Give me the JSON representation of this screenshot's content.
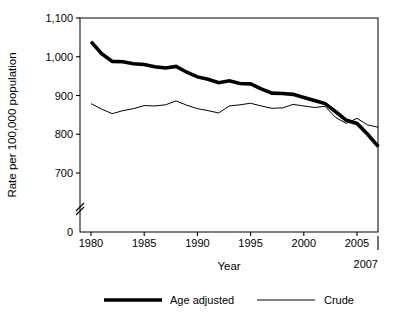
{
  "chart_data": {
    "type": "line",
    "title": "",
    "xlabel": "Year",
    "ylabel": "Rate per 100,000 population",
    "xlim": [
      1980,
      2007
    ],
    "ylim": [
      650,
      1100
    ],
    "y_axis_break": true,
    "y_break_label": "0",
    "grid": false,
    "legend_position": "bottom",
    "x": [
      1980,
      1981,
      1982,
      1983,
      1984,
      1985,
      1986,
      1987,
      1988,
      1989,
      1990,
      1991,
      1992,
      1993,
      1994,
      1995,
      1996,
      1997,
      1998,
      1999,
      2000,
      2001,
      2002,
      2003,
      2004,
      2005,
      2006,
      2007
    ],
    "xticks": [
      1980,
      1985,
      1990,
      1995,
      2000,
      2005
    ],
    "xticklabels": [
      "1980",
      "1985",
      "1990",
      "1995",
      "2000",
      "2005"
    ],
    "x_end_label": "2007",
    "yticks": [
      700,
      800,
      900,
      1000,
      1100
    ],
    "yticklabels": [
      "700",
      "800",
      "900",
      "1,000",
      "1,100"
    ],
    "series": [
      {
        "name": "Age adjusted",
        "style": "thick",
        "values": [
          1039,
          1008,
          988,
          987,
          982,
          980,
          974,
          971,
          975,
          960,
          948,
          942,
          933,
          938,
          931,
          930,
          917,
          906,
          905,
          903,
          895,
          887,
          879,
          858,
          836,
          828,
          800,
          768
        ]
      },
      {
        "name": "Crude",
        "style": "thin",
        "values": [
          879,
          865,
          853,
          861,
          866,
          874,
          873,
          876,
          886,
          875,
          866,
          861,
          855,
          873,
          876,
          880,
          873,
          867,
          868,
          877,
          873,
          869,
          872,
          843,
          828,
          841,
          824,
          818
        ]
      }
    ],
    "legend": [
      {
        "label": "Age adjusted",
        "style": "thick"
      },
      {
        "label": "Crude",
        "style": "thin"
      }
    ]
  }
}
